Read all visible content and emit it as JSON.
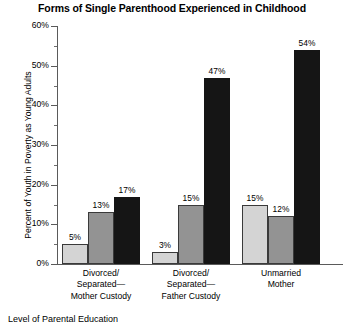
{
  "chart_data": {
    "type": "bar",
    "title": "Forms of Single Parenthood Experienced in Childhood",
    "xlabel": "",
    "ylabel": "Percent of Youth in Poverty as Young Adults",
    "ylim": [
      0,
      60
    ],
    "ytick_labels": [
      "0%",
      "10%",
      "20%",
      "30%",
      "40%",
      "50%",
      "60%"
    ],
    "ytick_values": [
      0,
      10,
      20,
      30,
      40,
      50,
      60
    ],
    "minor_tick_values": [
      5,
      15,
      25,
      35,
      45,
      55
    ],
    "grid": false,
    "legend_position": "bottom-clipped",
    "categories": [
      {
        "lines": [
          "Divorced/",
          "Separated—",
          "Mother Custody"
        ]
      },
      {
        "lines": [
          "Divorced/",
          "Separated—",
          "Father Custody"
        ]
      },
      {
        "lines": [
          "Unmarried",
          "Mother"
        ]
      }
    ],
    "series": [
      {
        "name": "series-1",
        "color": "#d4d4d4",
        "values": [
          5,
          3,
          15
        ],
        "labels": [
          "5%",
          "3%",
          "15%"
        ]
      },
      {
        "name": "series-2",
        "color": "#939393",
        "values": [
          13,
          15,
          12
        ],
        "labels": [
          "13%",
          "15%",
          "12%"
        ]
      },
      {
        "name": "series-3",
        "color": "#151515",
        "values": [
          17,
          47,
          54
        ],
        "labels": [
          "17%",
          "47%",
          "54%"
        ]
      }
    ]
  },
  "footer": {
    "clipped_legend": "Level of Parental Education"
  }
}
